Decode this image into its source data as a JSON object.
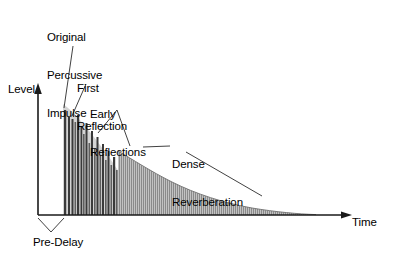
{
  "figure": {
    "axes": {
      "y_label": "Level",
      "x_label": "Time"
    },
    "annotations": {
      "original_impulse": "Original\nPercussive\nImpulse",
      "original_impulse_line1": "Original",
      "original_impulse_line2": "Percussive",
      "original_impulse_line3": "Impulse",
      "first_reflection_line1": "First",
      "first_reflection_line2": "Reflection",
      "early_reflections_line1": "Early",
      "early_reflections_line2": "Reflections",
      "dense_reverberation_line1": "Dense",
      "dense_reverberation_line2": "Reverberation",
      "pre_delay": "Pre-Delay"
    },
    "colors": {
      "background": "#ffffff",
      "axis": "#1a1a1a",
      "bar_dark": "#3a3a3a",
      "bar_mid": "#5e5e5e",
      "envelope_fill": "#c9c9c9",
      "dense_fill": "#7a7a7a",
      "dense_stripe": "#b5b5b5",
      "leader_line": "#2b2b2b",
      "text": "#000000"
    }
  },
  "chart_data": {
    "type": "area",
    "xlabel": "Time",
    "ylabel": "Level",
    "xlim": [
      0,
      100
    ],
    "ylim": [
      0,
      100
    ],
    "grid": false,
    "legend": null,
    "axis_origin_px": {
      "x": 38,
      "y": 215
    },
    "pre_delay_px": {
      "start": 38,
      "end": 63
    },
    "discrete_region_px": {
      "start": 63,
      "end": 118
    },
    "dense_region_px": {
      "start": 118,
      "end": 316
    },
    "series": [
      {
        "name": "Original Percussive Impulse",
        "type": "bar",
        "values": [
          {
            "x_px": 64.0,
            "height_px": 105.0,
            "width_px": 2.2,
            "shade": "dark"
          }
        ]
      },
      {
        "name": "First Reflection",
        "type": "bar",
        "values": [
          {
            "x_px": 68.0,
            "height_px": 98.0,
            "width_px": 2.0,
            "shade": "dark"
          }
        ]
      },
      {
        "name": "Early Reflections",
        "type": "bar",
        "values": [
          {
            "x_px": 71.5,
            "height_px": 96.0,
            "width_px": 2.0,
            "shade": "dark"
          },
          {
            "x_px": 74.5,
            "height_px": 93.0,
            "width_px": 1.6,
            "shade": "mid"
          },
          {
            "x_px": 77.0,
            "height_px": 100.0,
            "width_px": 2.2,
            "shade": "dark"
          },
          {
            "x_px": 80.5,
            "height_px": 88.0,
            "width_px": 1.8,
            "shade": "dark"
          },
          {
            "x_px": 83.0,
            "height_px": 81.0,
            "width_px": 1.6,
            "shade": "mid"
          },
          {
            "x_px": 85.5,
            "height_px": 92.0,
            "width_px": 2.0,
            "shade": "dark"
          },
          {
            "x_px": 88.5,
            "height_px": 72.0,
            "width_px": 1.6,
            "shade": "mid"
          },
          {
            "x_px": 91.0,
            "height_px": 84.0,
            "width_px": 2.0,
            "shade": "dark"
          },
          {
            "x_px": 94.0,
            "height_px": 66.0,
            "width_px": 1.6,
            "shade": "mid"
          },
          {
            "x_px": 96.5,
            "height_px": 78.0,
            "width_px": 2.0,
            "shade": "dark"
          },
          {
            "x_px": 99.5,
            "height_px": 60.0,
            "width_px": 1.6,
            "shade": "mid"
          },
          {
            "x_px": 102.0,
            "height_px": 71.0,
            "width_px": 2.0,
            "shade": "dark"
          },
          {
            "x_px": 105.0,
            "height_px": 55.0,
            "width_px": 1.6,
            "shade": "mid"
          },
          {
            "x_px": 107.5,
            "height_px": 64.0,
            "width_px": 2.0,
            "shade": "dark"
          },
          {
            "x_px": 110.5,
            "height_px": 50.0,
            "width_px": 1.6,
            "shade": "mid"
          },
          {
            "x_px": 113.0,
            "height_px": 58.0,
            "width_px": 2.2,
            "shade": "dark"
          },
          {
            "x_px": 116.0,
            "height_px": 45.0,
            "width_px": 1.6,
            "shade": "mid"
          }
        ]
      },
      {
        "name": "Dense Reverberation",
        "type": "area",
        "decay": "exponential",
        "start_x_px": 118,
        "start_height_px": 64,
        "end_x_px": 316,
        "end_height_px": 1,
        "envelope_points_px": [
          {
            "x": 118,
            "h": 64
          },
          {
            "x": 130,
            "h": 55
          },
          {
            "x": 145,
            "h": 46
          },
          {
            "x": 160,
            "h": 38
          },
          {
            "x": 175,
            "h": 31
          },
          {
            "x": 190,
            "h": 25
          },
          {
            "x": 205,
            "h": 20
          },
          {
            "x": 220,
            "h": 16
          },
          {
            "x": 235,
            "h": 12
          },
          {
            "x": 250,
            "h": 9
          },
          {
            "x": 265,
            "h": 6.5
          },
          {
            "x": 280,
            "h": 4.5
          },
          {
            "x": 295,
            "h": 3
          },
          {
            "x": 305,
            "h": 2
          },
          {
            "x": 316,
            "h": 1
          }
        ]
      },
      {
        "name": "Envelope Highlight",
        "type": "area",
        "note": "light grey wedge behind early reflection bars",
        "points_px": [
          {
            "x": 63,
            "h": 108
          },
          {
            "x": 85,
            "h": 95
          },
          {
            "x": 105,
            "h": 80
          },
          {
            "x": 118,
            "h": 66
          }
        ]
      }
    ]
  }
}
